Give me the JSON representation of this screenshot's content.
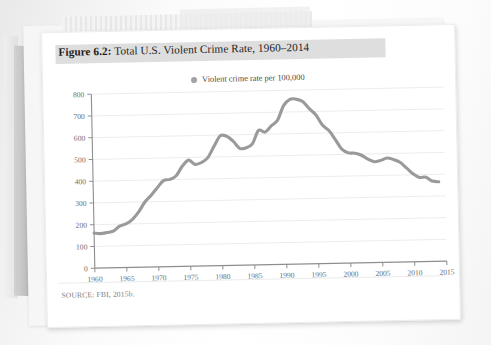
{
  "figure": {
    "label": "Figure 6.2:",
    "title": " Total U.S. Violent Crime Rate, 1960–2014",
    "source": "SOURCE: FBI, 2015b.",
    "legend_label": "Violent crime rate per 100,000",
    "line_color": "#9a9a9a",
    "grid_color": "#e7e7e7",
    "axis_color": "#8e8e8e",
    "title_band_color": "#dedede"
  },
  "chart_data": {
    "type": "line",
    "title": "Total U.S. Violent Crime Rate, 1960–2014",
    "xlabel": "",
    "ylabel": "",
    "legend": [
      "Violent crime rate per 100,000"
    ],
    "legend_position": "top-center",
    "grid": true,
    "xlim": [
      1960,
      2015
    ],
    "ylim": [
      0,
      800
    ],
    "ytick_step": 100,
    "xtick_step": 5,
    "yticks": [
      0,
      100,
      200,
      300,
      400,
      500,
      600,
      700,
      800
    ],
    "xticks": [
      1960,
      1965,
      1970,
      1975,
      1980,
      1985,
      1990,
      1995,
      2000,
      2005,
      2010,
      2015
    ],
    "x": [
      1960,
      1961,
      1962,
      1963,
      1964,
      1965,
      1966,
      1967,
      1968,
      1969,
      1970,
      1971,
      1972,
      1973,
      1974,
      1975,
      1976,
      1977,
      1978,
      1979,
      1980,
      1981,
      1982,
      1983,
      1984,
      1985,
      1986,
      1987,
      1988,
      1989,
      1990,
      1991,
      1992,
      1993,
      1994,
      1995,
      1996,
      1997,
      1998,
      1999,
      2000,
      2001,
      2002,
      2003,
      2004,
      2005,
      2006,
      2007,
      2008,
      2009,
      2010,
      2011,
      2012,
      2013,
      2014
    ],
    "series": [
      {
        "name": "Violent crime rate per 100,000",
        "values": [
          160.9,
          158.1,
          162.3,
          168.2,
          190.6,
          200.2,
          220.0,
          253.2,
          298.4,
          328.7,
          363.5,
          396.0,
          401.0,
          417.4,
          461.1,
          487.8,
          467.8,
          475.9,
          497.8,
          548.9,
          596.6,
          594.3,
          571.1,
          537.7,
          539.2,
          556.6,
          617.7,
          609.7,
          637.2,
          663.1,
          729.6,
          758.2,
          757.7,
          747.1,
          713.6,
          684.5,
          636.6,
          611.0,
          567.6,
          523.0,
          506.5,
          504.5,
          494.4,
          475.8,
          463.2,
          469.0,
          479.3,
          471.8,
          458.6,
          431.9,
          404.5,
          387.1,
          387.8,
          369.1,
          365.5
        ]
      }
    ]
  }
}
